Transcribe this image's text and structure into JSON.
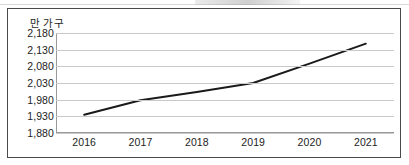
{
  "chart_data": {
    "type": "line",
    "title": "",
    "subtitle": "",
    "xlabel": "",
    "ylabel": "만 가구",
    "unit_label": "만 가구",
    "categories": [
      "2016",
      "2017",
      "2018",
      "2019",
      "2020",
      "2021"
    ],
    "x": [
      2016,
      2017,
      2018,
      2019,
      2020,
      2021
    ],
    "values": [
      1935,
      1978,
      2003,
      2030,
      2088,
      2148
    ],
    "series": [
      {
        "name": "",
        "values": [
          1935,
          1978,
          2003,
          2030,
          2088,
          2148
        ],
        "color": "#1a1a1a",
        "line_width": 2,
        "markers": false
      }
    ],
    "ylim": [
      1880,
      2180
    ],
    "ytick_values": [
      2180,
      2130,
      2080,
      2030,
      1980,
      1930,
      1880
    ],
    "ytick_labels": [
      "2,180",
      "2,130",
      "2,080",
      "2,030",
      "1,980",
      "1,930",
      "1,880"
    ],
    "xtick_labels": [
      "2016",
      "2017",
      "2018",
      "2019",
      "2020",
      "2021"
    ],
    "grid": true,
    "grid_axis": "y",
    "legend": false,
    "legend_position": "none",
    "annotations": []
  },
  "figure": {
    "border_color": "#4a4a4a",
    "grid_color": "#c9c9c9",
    "axis_color": "#9a9a9a",
    "line_color": "#1a1a1a",
    "background": "#ffffff"
  }
}
